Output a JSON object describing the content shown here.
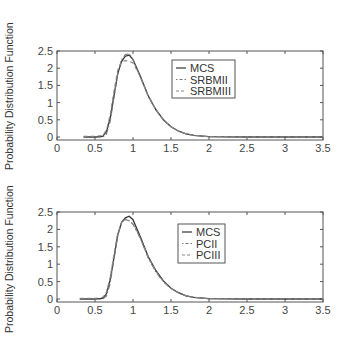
{
  "chart_data": [
    {
      "type": "line",
      "title": "",
      "xlabel": "",
      "ylabel": "Probability Distribution Function",
      "xlim": [
        0,
        3.5
      ],
      "ylim": [
        -0.1,
        2.5
      ],
      "xticks": [
        "0",
        "0.5",
        "1",
        "1.5",
        "2",
        "2.5",
        "3",
        "3.5"
      ],
      "yticks": [
        "0",
        "0.5",
        "1",
        "1.5",
        "2",
        "2.5"
      ],
      "grid": false,
      "legend_position": "upper center",
      "x": [
        0.35,
        0.5,
        0.6,
        0.65,
        0.7,
        0.75,
        0.8,
        0.85,
        0.9,
        0.95,
        1.0,
        1.05,
        1.1,
        1.2,
        1.3,
        1.4,
        1.5,
        1.6,
        1.7,
        1.8,
        2.0,
        2.5,
        3.0,
        3.5
      ],
      "series": [
        {
          "name": "MCS",
          "style": "solid",
          "values": [
            0,
            0,
            0.02,
            0.15,
            0.55,
            1.2,
            1.85,
            2.2,
            2.35,
            2.38,
            2.25,
            2.0,
            1.75,
            1.2,
            0.8,
            0.5,
            0.3,
            0.17,
            0.09,
            0.05,
            0.01,
            0,
            0,
            0
          ]
        },
        {
          "name": "SRBMII",
          "style": "dashdot",
          "values": [
            0,
            0,
            0,
            0.08,
            0.45,
            1.15,
            1.85,
            2.25,
            2.4,
            2.42,
            2.25,
            1.98,
            1.72,
            1.18,
            0.78,
            0.49,
            0.3,
            0.17,
            0.09,
            0.05,
            0.01,
            0,
            0,
            0
          ]
        },
        {
          "name": "SRBMIII",
          "style": "dashed",
          "values": [
            0.02,
            0.02,
            0.05,
            0.2,
            0.65,
            1.35,
            1.95,
            2.2,
            2.22,
            2.2,
            2.15,
            1.95,
            1.72,
            1.2,
            0.8,
            0.5,
            0.3,
            0.17,
            0.09,
            0.05,
            0.01,
            0,
            0,
            0
          ]
        }
      ]
    },
    {
      "type": "line",
      "title": "",
      "xlabel": "",
      "ylabel": "Probability Distribution Function",
      "xlim": [
        0,
        3.5
      ],
      "ylim": [
        -0.1,
        2.5
      ],
      "xticks": [
        "0",
        "0.5",
        "1",
        "1.5",
        "2",
        "2.5",
        "3",
        "3.5"
      ],
      "yticks": [
        "0",
        "0.5",
        "1",
        "1.5",
        "2",
        "2.5"
      ],
      "grid": false,
      "legend_position": "upper center",
      "x": [
        0.3,
        0.5,
        0.6,
        0.65,
        0.7,
        0.75,
        0.8,
        0.85,
        0.9,
        0.95,
        1.0,
        1.05,
        1.1,
        1.2,
        1.3,
        1.4,
        1.5,
        1.6,
        1.7,
        1.8,
        2.0,
        2.5,
        3.0,
        3.5
      ],
      "series": [
        {
          "name": "MCS",
          "style": "solid",
          "values": [
            0,
            0,
            0.02,
            0.15,
            0.55,
            1.2,
            1.85,
            2.2,
            2.33,
            2.38,
            2.28,
            2.03,
            1.77,
            1.22,
            0.82,
            0.52,
            0.31,
            0.18,
            0.09,
            0.05,
            0.01,
            0,
            0,
            0
          ]
        },
        {
          "name": "PCII",
          "style": "dashdot",
          "values": [
            0,
            0,
            0,
            0.08,
            0.45,
            1.15,
            1.82,
            2.2,
            2.3,
            2.25,
            2.15,
            1.95,
            1.72,
            1.18,
            0.78,
            0.49,
            0.3,
            0.17,
            0.09,
            0.05,
            0.01,
            0,
            0,
            0
          ]
        },
        {
          "name": "PCIII",
          "style": "dashed",
          "values": [
            0.02,
            0.02,
            0.05,
            0.2,
            0.62,
            1.3,
            1.9,
            2.2,
            2.28,
            2.25,
            2.15,
            1.95,
            1.72,
            1.2,
            0.8,
            0.5,
            0.3,
            0.17,
            0.09,
            0.05,
            0.01,
            0,
            0,
            0
          ]
        }
      ]
    }
  ],
  "panels": [
    {
      "ylabel": "Probability Distribution Function",
      "legend": [
        "MCS",
        "SRBMII",
        "SRBMIII"
      ]
    },
    {
      "ylabel": "Probability Distribution Function",
      "legend": [
        "MCS",
        "PCII",
        "PCIII"
      ]
    }
  ]
}
